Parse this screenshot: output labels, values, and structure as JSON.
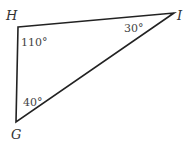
{
  "diagram": {
    "type": "triangle",
    "vertices": {
      "H": {
        "label": "H",
        "angle": "110°"
      },
      "I": {
        "label": "I",
        "angle": "30°"
      },
      "G": {
        "label": "G",
        "angle": "40°"
      }
    },
    "colors": {
      "stroke": "#222222",
      "label": "#333333"
    }
  }
}
